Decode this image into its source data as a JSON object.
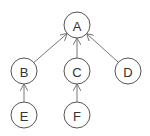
{
  "diagram": {
    "type": "tree",
    "nodes": [
      {
        "id": "A",
        "label": "A",
        "x": 77,
        "y": 25
      },
      {
        "id": "B",
        "label": "B",
        "x": 24,
        "y": 71
      },
      {
        "id": "C",
        "label": "C",
        "x": 77,
        "y": 71
      },
      {
        "id": "D",
        "label": "D",
        "x": 128,
        "y": 71
      },
      {
        "id": "E",
        "label": "E",
        "x": 24,
        "y": 115
      },
      {
        "id": "F",
        "label": "F",
        "x": 77,
        "y": 115
      }
    ],
    "edges": [
      {
        "from": "B",
        "to": "A"
      },
      {
        "from": "C",
        "to": "A"
      },
      {
        "from": "D",
        "to": "A"
      },
      {
        "from": "E",
        "to": "B"
      },
      {
        "from": "F",
        "to": "C"
      }
    ],
    "node_radius": 13,
    "colors": {
      "stroke": "#555555",
      "edge": "#777777",
      "text": "#333333",
      "background": "#ffffff"
    }
  }
}
